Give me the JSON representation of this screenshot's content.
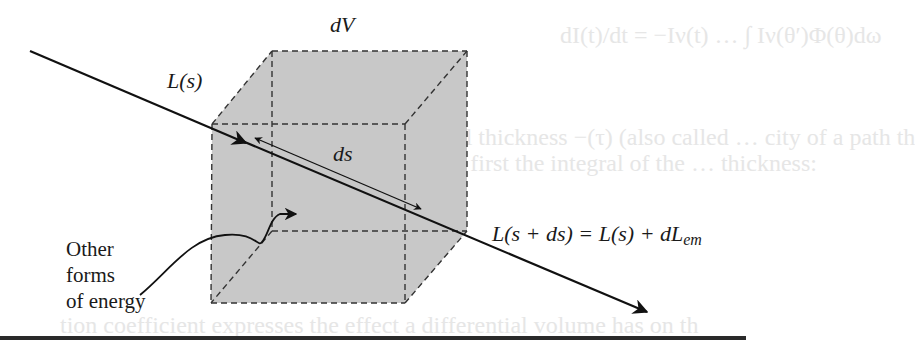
{
  "figure": {
    "labels": {
      "volume": "dV",
      "radiance_in": "L(s)",
      "path_element": "ds",
      "radiance_out_lhs": "L(s + ds) = L(s) + dL",
      "radiance_out_sub": "em",
      "other_energy": [
        "Other",
        "forms",
        "of energy"
      ]
    },
    "colors": {
      "cube_fill": "#c8c8c8",
      "line": "#111111",
      "dash": "#333333",
      "ghost_text": "#e6e6e6"
    }
  },
  "background_bleed_text": {
    "line1": "dI(t)/dt = −Iν(t) … ∫ Iν(θ′)Φ(θ)dω",
    "line2": "al thickness −(τ) (also called … city of a path th",
    "line3": "s first the integral of the … thickness:",
    "line4": "tion coefficient expresses the effect a differential volume has on th"
  }
}
